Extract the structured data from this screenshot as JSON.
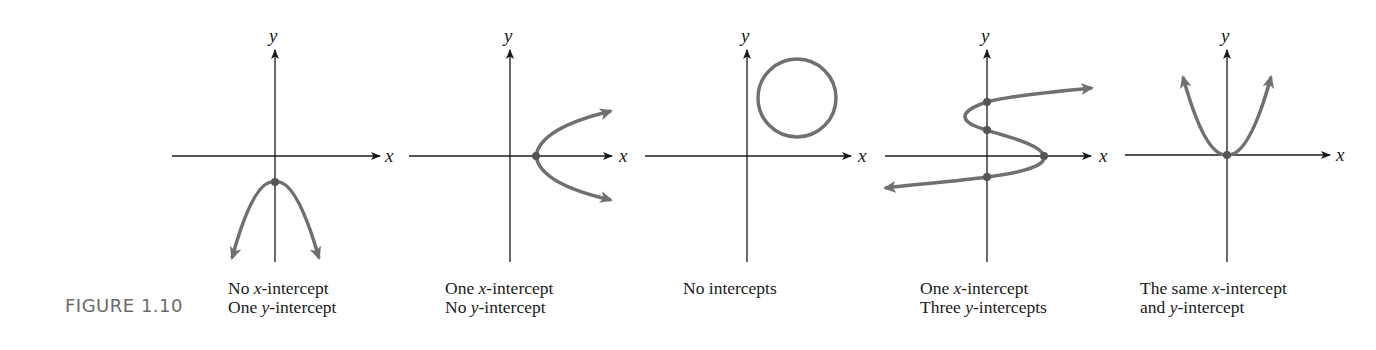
{
  "figure": {
    "label": "FIGURE 1.10",
    "axis_labels": {
      "x": "x",
      "y": "y"
    },
    "colors": {
      "axis": "#1a1a1a",
      "curve": "#707070",
      "intercept_point": "#555555",
      "figure_label": "#6a6a6a"
    },
    "panels": [
      {
        "id": "panel-1",
        "shape": "downward parabola",
        "caption_line1": "No x-intercept",
        "caption_line2": "One y-intercept",
        "x_intercepts": 0,
        "y_intercepts": 1
      },
      {
        "id": "panel-2",
        "shape": "rightward parabola",
        "caption_line1": "One x-intercept",
        "caption_line2": "No y-intercept",
        "x_intercepts": 1,
        "y_intercepts": 0
      },
      {
        "id": "panel-3",
        "shape": "circle in first quadrant",
        "caption_line1": "No intercepts",
        "caption_line2": "",
        "x_intercepts": 0,
        "y_intercepts": 0
      },
      {
        "id": "panel-4",
        "shape": "S-shaped curve",
        "caption_line1": "One x-intercept",
        "caption_line2": "Three y-intercepts",
        "x_intercepts": 1,
        "y_intercepts": 3
      },
      {
        "id": "panel-5",
        "shape": "upward parabola through origin",
        "caption_line1": "The same x-intercept",
        "caption_line2": "and y-intercept",
        "x_intercepts": 1,
        "y_intercepts": 1
      }
    ]
  }
}
